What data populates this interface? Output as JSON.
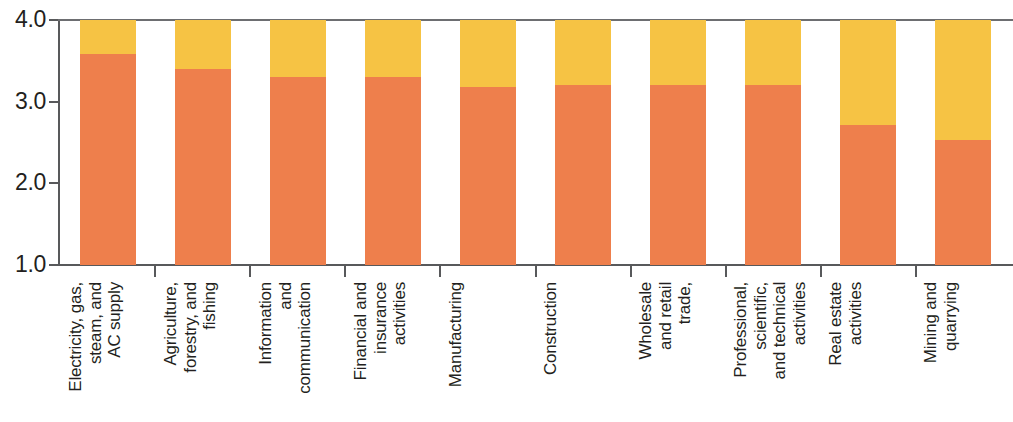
{
  "chart_data": {
    "type": "bar",
    "stacked": true,
    "title": "",
    "subtitle": "",
    "xlabel": "",
    "ylabel": "",
    "ylim": [
      1.0,
      4.0
    ],
    "ytick_labels": [
      "1.0",
      "2.0",
      "3.0",
      "4.0"
    ],
    "yticks": [
      1.0,
      2.0,
      3.0,
      4.0
    ],
    "grid": false,
    "legend": null,
    "legend_position": "none",
    "bar_base": 1.0,
    "bar_top": 4.0,
    "categories": [
      "Electricity, gas,\nsteam, and\nAC supply",
      "Agriculture,\nforestry, and\nfishing",
      "Information\nand\ncommunication",
      "Financial and\ninsurance\nactivities",
      "Manufacturing",
      "Construction",
      "Wholesale\nand retail\ntrade,",
      "Professional,\nscientific,\nand technical\nactivities",
      "Real estate\nactivities",
      "Mining and\nquarrying"
    ],
    "series": [
      {
        "name": "lower-segment",
        "color": "#ee7f4c",
        "values": [
          3.58,
          3.4,
          3.3,
          3.3,
          3.18,
          3.2,
          3.2,
          3.21,
          2.71,
          2.53
        ]
      },
      {
        "name": "upper-segment",
        "color": "#f6c344",
        "values": [
          4.0,
          4.0,
          4.0,
          4.0,
          4.0,
          4.0,
          4.0,
          4.0,
          4.0,
          4.0
        ]
      }
    ],
    "colors": {
      "lower": "#ee7f4c",
      "upper": "#f6c344",
      "axis": "#58595b",
      "text": "#231f20",
      "background": "#ffffff"
    }
  }
}
